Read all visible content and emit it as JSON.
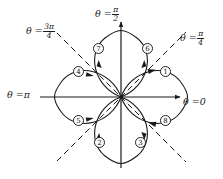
{
  "figure": {
    "type": "polar-rose-curve",
    "curve_equation": "r = cos(2theta)",
    "petal_count": 4,
    "traced_segments": 8,
    "center_px": [
      121,
      97
    ],
    "petal_length_px": 62
  },
  "axis_labels": [
    {
      "id": "theta-zero",
      "theta_text": "θ =",
      "value_text": "0",
      "kind": "plain",
      "x": 183,
      "y": 97,
      "align": "left"
    },
    {
      "id": "theta-pi",
      "theta_text": "θ =",
      "value_text": "π",
      "kind": "plain",
      "x": 7,
      "y": 90,
      "align": "left"
    },
    {
      "id": "theta-pi-over-2",
      "theta_text": "θ =",
      "num": "π",
      "den": "2",
      "kind": "fraction",
      "x": 95,
      "y": 6,
      "align": "left"
    },
    {
      "id": "theta-pi-over-4",
      "theta_text": "θ =",
      "num": "π",
      "den": "4",
      "kind": "fraction",
      "x": 180,
      "y": 30,
      "align": "left"
    },
    {
      "id": "theta-3pi-over-4",
      "theta_text": "θ =",
      "num": "3π",
      "den": "4",
      "kind": "fraction",
      "x": 26,
      "y": 23,
      "align": "left"
    }
  ],
  "petal_markers": [
    {
      "id": "marker-1",
      "label": "①",
      "text": "1",
      "x": 160,
      "y": 66
    },
    {
      "id": "marker-2",
      "label": "②",
      "text": "2",
      "x": 94,
      "y": 137
    },
    {
      "id": "marker-3",
      "label": "③",
      "text": "3",
      "x": 135,
      "y": 137
    },
    {
      "id": "marker-4",
      "label": "④",
      "text": "4",
      "x": 73,
      "y": 66
    },
    {
      "id": "marker-5",
      "label": "⑤",
      "text": "5",
      "x": 73,
      "y": 115
    },
    {
      "id": "marker-6",
      "label": "⑥",
      "text": "6",
      "x": 142,
      "y": 43
    },
    {
      "id": "marker-7",
      "label": "⑦",
      "text": "7",
      "x": 93,
      "y": 43
    },
    {
      "id": "marker-8",
      "label": "⑧",
      "text": "8",
      "x": 160,
      "y": 115
    }
  ],
  "colors": {
    "stroke": "#1a1a1a",
    "background": "#ffffff",
    "dashed": "#1a1a1a"
  }
}
